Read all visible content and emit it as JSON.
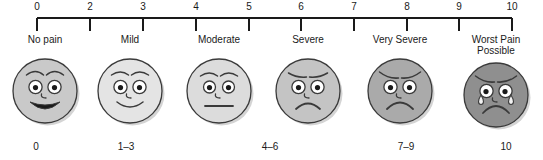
{
  "chart_data": {
    "type": "table",
    "xlabel": "Pain intensity",
    "ylabel": "",
    "xlim": [
      0,
      10
    ],
    "grid": false,
    "legend": "none",
    "axis": {
      "line_color": "#1a1a1a",
      "tick_labels": [
        "0",
        "2",
        "3",
        "4",
        "5",
        "6",
        "7",
        "8",
        "9",
        "10"
      ],
      "tick_values": [
        0,
        2,
        3,
        4,
        5,
        6,
        7,
        8,
        9,
        10
      ]
    },
    "categories": [
      "No pain",
      "Mild",
      "Moderate",
      "Severe",
      "Very Severe",
      "Worst Pain Possible"
    ],
    "values": [
      0,
      2,
      5,
      6,
      8,
      10
    ],
    "value_ranges": [
      "0",
      "1–3",
      "4–6",
      "7–9",
      "10"
    ]
  },
  "ruler": {
    "ticks": [
      {
        "label": "0",
        "x": 37
      },
      {
        "label": "2",
        "x": 90
      },
      {
        "label": "3",
        "x": 143
      },
      {
        "label": "4",
        "x": 196
      },
      {
        "label": "5",
        "x": 249
      },
      {
        "label": "6",
        "x": 301
      },
      {
        "label": "7",
        "x": 354
      },
      {
        "label": "8",
        "x": 407
      },
      {
        "label": "9",
        "x": 459
      },
      {
        "label": "10",
        "x": 512
      }
    ]
  },
  "faces": [
    {
      "label": "No pain",
      "value": "0",
      "center_x": 45,
      "fill": "#c9c9c9",
      "mood": "very-happy",
      "icon": "face-very-happy-icon"
    },
    {
      "label": "Mild",
      "value": "1–3",
      "center_x": 130,
      "fill": "#e4e4e4",
      "mood": "happy",
      "icon": "face-happy-icon"
    },
    {
      "label": "Moderate",
      "value": "",
      "center_x": 219,
      "fill": "#dcdcdc",
      "mood": "neutral",
      "icon": "face-neutral-icon"
    },
    {
      "label": "Severe",
      "value": "4–6",
      "center_x": 308,
      "fill": "#c4c4c4",
      "mood": "sad",
      "icon": "face-sad-icon"
    },
    {
      "label": "Very Severe",
      "value": "7–9",
      "center_x": 400,
      "fill": "#aaaaaa",
      "mood": "very-sad",
      "icon": "face-very-sad-icon"
    },
    {
      "label": "Worst Pain Possible",
      "value": "10",
      "center_x": 496,
      "fill": "#8f8f8f",
      "mood": "crying",
      "icon": "face-crying-icon"
    }
  ],
  "value_labels": [
    {
      "text": "0",
      "x": 36
    },
    {
      "text": "1–3",
      "x": 126
    },
    {
      "text": "4–6",
      "x": 270
    },
    {
      "text": "7–9",
      "x": 406
    },
    {
      "text": "10",
      "x": 506
    }
  ],
  "colors": {
    "ink": "#1a1a1a",
    "background": "#ffffff",
    "stroke": "#3a3a3a",
    "shadow": "#bdbdbd"
  }
}
